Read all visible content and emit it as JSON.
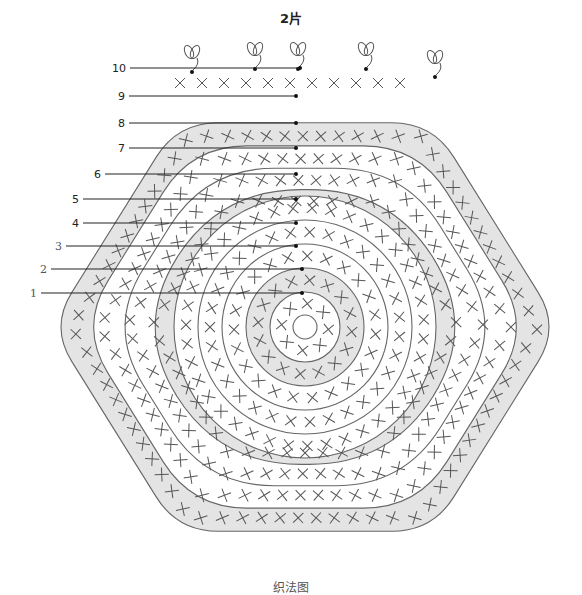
{
  "title": "2片",
  "caption": "织法图",
  "center": {
    "x": 305,
    "y": 327
  },
  "colors": {
    "shaded_band": "#e4e4e4",
    "white_band": "#ffffff",
    "outline": "#666666",
    "stitch": "#555555",
    "leader": "#222222"
  },
  "rows": [
    {
      "row": 1,
      "label": "1",
      "label_x": 30,
      "label_y": 297,
      "style": "serif",
      "shape": "circle",
      "r_in": 12,
      "r_out": 35,
      "shaded": false
    },
    {
      "row": 2,
      "label": "2",
      "label_x": 40,
      "label_y": 273,
      "style": "serif",
      "shape": "circle",
      "r_in": 35,
      "r_out": 59,
      "shaded": true
    },
    {
      "row": 3,
      "label": "3",
      "label_x": 55,
      "label_y": 250,
      "style": "serif",
      "shape": "circle",
      "r_in": 59,
      "r_out": 83,
      "shaded": false
    },
    {
      "row": 4,
      "label": "4",
      "label_x": 72,
      "label_y": 227,
      "style": "sans",
      "shape": "circle",
      "r_in": 83,
      "r_out": 107,
      "shaded": false
    },
    {
      "row": 5,
      "label": "5",
      "label_x": 72,
      "label_y": 203,
      "style": "sans",
      "shape": "circle",
      "r_in": 107,
      "r_out": 131,
      "shaded": false
    },
    {
      "row": 6,
      "label": "6",
      "label_x": 94,
      "label_y": 178,
      "style": "sans",
      "shape": "hex",
      "r_in": 131,
      "r_out": 154,
      "shaded": true
    },
    {
      "row": 7,
      "label": "7",
      "label_x": 118,
      "label_y": 152,
      "style": "sans",
      "shape": "hex",
      "r_in": 154,
      "r_out": 178,
      "shaded": false
    },
    {
      "row": 8,
      "label": "8",
      "label_x": 118,
      "label_y": 127,
      "style": "sans",
      "shape": "hex",
      "r_in": 178,
      "r_out": 203,
      "shaded": false
    },
    {
      "row": 9,
      "label": "9",
      "label_x": 118,
      "label_y": 100,
      "style": "sans",
      "shape": "hex",
      "r_in": 203,
      "r_out": 229,
      "shaded": true
    },
    {
      "row": 10,
      "label": "10",
      "label_x": 112,
      "label_y": 72,
      "style": "sans",
      "shape": "edge",
      "r_in": 229,
      "r_out": 250,
      "shaded": false
    }
  ],
  "legend_symbols": {
    "single_crochet": "X",
    "chain": "0",
    "slip_stitch": "●",
    "picot_loop": "ꝏ",
    "increase": "V-shaped double X",
    "cluster": "ladder symbol"
  },
  "picot_positions": [
    {
      "x": 192,
      "y": 60
    },
    {
      "x": 255,
      "y": 57
    },
    {
      "x": 298,
      "y": 57
    },
    {
      "x": 366,
      "y": 57
    },
    {
      "x": 435,
      "y": 65
    }
  ]
}
